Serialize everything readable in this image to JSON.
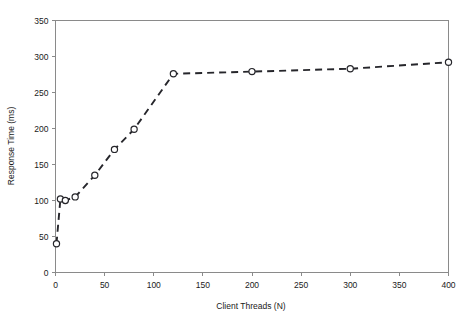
{
  "chart_data": {
    "type": "line",
    "title": "",
    "xlabel": "Client Threads (N)",
    "ylabel": "Response Time (ms)",
    "xlim": [
      0,
      400
    ],
    "ylim": [
      0,
      350
    ],
    "grid": false,
    "legend": false,
    "x_ticks": [
      0,
      50,
      100,
      150,
      200,
      250,
      300,
      350,
      400
    ],
    "y_ticks": [
      0,
      50,
      100,
      150,
      200,
      250,
      300,
      350
    ],
    "x_tick_labels": [
      "0",
      "50",
      "100",
      "150",
      "200",
      "250",
      "300",
      "350",
      "400"
    ],
    "y_tick_labels": [
      "0",
      "50",
      "100",
      "150",
      "200",
      "250",
      "300",
      "350"
    ],
    "marker": "open-circle",
    "line_style": "dashed",
    "series": [
      {
        "name": "Response Time",
        "x": [
          1,
          5,
          10,
          20,
          40,
          60,
          80,
          120,
          200,
          300,
          400
        ],
        "values": [
          40,
          102,
          100,
          105,
          135,
          171,
          199,
          276,
          279,
          283,
          292
        ]
      }
    ]
  },
  "axes": {
    "x_title": "Client Threads (N)",
    "y_title": "Response Time (ms)"
  }
}
